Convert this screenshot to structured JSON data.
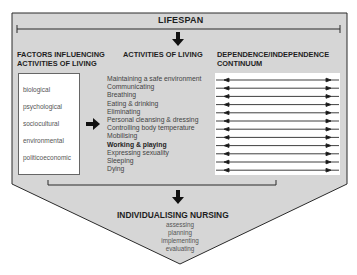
{
  "diagram": {
    "top_label": "LIFESPAN",
    "columns": {
      "factors": {
        "heading_line1": "FACTORS INFLUENCING",
        "heading_line2": "ACTIVITIES OF LIVING",
        "items": [
          "biological",
          "psychological",
          "sociocultural",
          "environmental",
          "politicoeconomic"
        ]
      },
      "activities": {
        "heading": "ACTIVITIES OF LIVING",
        "items": [
          {
            "label": "Maintaining a safe environment",
            "bold": false
          },
          {
            "label": "Communicating",
            "bold": false
          },
          {
            "label": "Breathing",
            "bold": false
          },
          {
            "label": "Eating & drinking",
            "bold": false
          },
          {
            "label": "Eliminating",
            "bold": false
          },
          {
            "label": "Personal cleansing & dressing",
            "bold": false
          },
          {
            "label": "Controlling body temperature",
            "bold": false
          },
          {
            "label": "Mobilising",
            "bold": false
          },
          {
            "label": "Working & playing",
            "bold": true
          },
          {
            "label": "Expressing sexuality",
            "bold": false
          },
          {
            "label": "Sleeping",
            "bold": false
          },
          {
            "label": "Dying",
            "bold": false
          }
        ]
      },
      "continuum": {
        "heading_line1": "DEPENDENCE/INDEPENDENCE",
        "heading_line2": "CONTINUUM",
        "arrow_count": 12
      }
    },
    "output": {
      "title": "INDIVIDUALISING NURSING",
      "steps": [
        "assessing",
        "planning",
        "implementing",
        "evaluating"
      ]
    },
    "colors": {
      "fill": "#d6d6d6",
      "stroke": "#2a2a2a",
      "panel": "#ffffff",
      "text": "#1e1e1e"
    }
  }
}
